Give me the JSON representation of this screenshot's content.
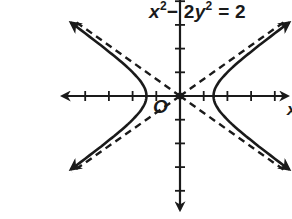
{
  "chart_data": {
    "type": "diagram",
    "equation": {
      "display_parts": [
        "x",
        "2",
        "− 2y",
        "2",
        " = 2"
      ],
      "a": 1.414,
      "b": 1
    },
    "curve": "hyperbola",
    "vertices": [
      [
        -1.414,
        0
      ],
      [
        1.414,
        0
      ]
    ],
    "asymptotes": [
      "y = x/√2",
      "y = -x/√2"
    ],
    "asymptote_style": "dashed",
    "axes": {
      "x_label": "x",
      "origin_label": "O",
      "x_ticks": [
        -4,
        -3,
        -2,
        -1,
        1,
        2,
        3,
        4
      ],
      "y_ticks": [
        -4,
        -3,
        -2,
        -1,
        1,
        2,
        3,
        4
      ],
      "xlim": [
        -5,
        5
      ],
      "ylim": [
        -5,
        4
      ]
    },
    "grid": false
  },
  "labels": {
    "eq_x": "x",
    "eq_exp1": "2",
    "eq_mid": "− 2",
    "eq_y": "y",
    "eq_exp2": "2",
    "eq_end": " = 2",
    "origin": "O",
    "x_axis": "x"
  },
  "colors": {
    "ink": "#1a1a1a",
    "background": "#ffffff"
  }
}
